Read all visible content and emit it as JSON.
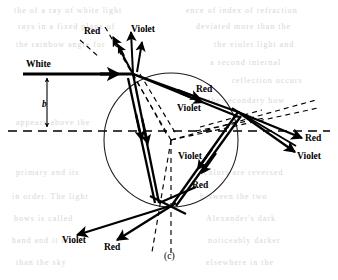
{
  "figure": {
    "caption": "(c)",
    "caption_label": "c",
    "labels": {
      "white": "White",
      "impact_parameter": "b",
      "red": "Red",
      "violet": "Violet"
    },
    "label_positions": [
      {
        "id": "white-ray-label",
        "text": "White",
        "x": 26,
        "y": 60,
        "italic": false
      },
      {
        "id": "impact-parameter-label",
        "text": "b",
        "x": 42,
        "y": 100,
        "italic": true
      },
      {
        "id": "red-label-top",
        "text": "Red",
        "x": 84,
        "y": 27,
        "italic": false
      },
      {
        "id": "violet-label-top",
        "text": "Violet",
        "x": 131,
        "y": 25,
        "italic": false
      },
      {
        "id": "red-label-inner-upper",
        "text": "Red",
        "x": 196,
        "y": 85,
        "italic": false
      },
      {
        "id": "violet-label-inner",
        "text": "Violet",
        "x": 177,
        "y": 104,
        "italic": false
      },
      {
        "id": "red-label-right-exit",
        "text": "Red",
        "x": 305,
        "y": 134,
        "italic": false
      },
      {
        "id": "violet-label-right-exit",
        "text": "Violet",
        "x": 297,
        "y": 152,
        "italic": false
      },
      {
        "id": "violet-label-lower",
        "text": "Violet",
        "x": 178,
        "y": 152,
        "italic": false
      },
      {
        "id": "red-label-lower-inner",
        "text": "Red",
        "x": 192,
        "y": 181,
        "italic": false
      },
      {
        "id": "violet-label-exit-left",
        "text": "Violet",
        "x": 62,
        "y": 236,
        "italic": false
      },
      {
        "id": "red-label-exit-left",
        "text": "Red",
        "x": 104,
        "y": 243,
        "italic": false
      }
    ]
  },
  "chart_data": {
    "type": "diagram",
    "subtitle": "(c)",
    "drop": {
      "center_x": 171,
      "center_y": 140,
      "radius": 67,
      "stroke": "#1a1a1a"
    },
    "axis": {
      "kind": "horizontal-dashed-axis",
      "y": 131,
      "x_start": 8,
      "x_end": 330
    },
    "impact_parameter": {
      "symbol": "b",
      "from_y": 74,
      "to_y": 131,
      "x": 47
    },
    "incident_ray": {
      "label": "White",
      "from": [
        23,
        74
      ],
      "to": [
        133,
        74
      ],
      "color": "#000000"
    },
    "vertex_points": {
      "entry": [
        133,
        74
      ],
      "right_internal_reflection": [
        238,
        112
      ],
      "lower_internal_reflection_violet": [
        159,
        203
      ],
      "lower_internal_reflection_red": [
        173,
        205
      ]
    },
    "ray_colors": {
      "red": "#000000",
      "violet": "#000000",
      "dashed_normal": "#2a2a2a"
    },
    "legend_entries": [
      "White",
      "Red",
      "Violet"
    ]
  },
  "ghost_text": [
    {
      "text": "the  of  a  ray  of  white  light",
      "x": 14,
      "y": 6
    },
    {
      "text": "ence  of  index  of  refraction",
      "x": 186,
      "y": 6
    },
    {
      "text": "rays  in  a  fixed  plane  of",
      "x": 18,
      "y": 22
    },
    {
      "text": "deviated  more  than  the",
      "x": 196,
      "y": 22
    },
    {
      "text": "the  rainbow  angle  for",
      "x": 16,
      "y": 40
    },
    {
      "text": "the  violet  light  and",
      "x": 214,
      "y": 40
    },
    {
      "text": "a  second  internal",
      "x": 210,
      "y": 58
    },
    {
      "text": "reflection  occurs",
      "x": 232,
      "y": 76
    },
    {
      "text": "the  secondary  bow",
      "x": 208,
      "y": 96
    },
    {
      "text": "appears  above  the",
      "x": 16,
      "y": 118
    },
    {
      "text": "primary  and  its",
      "x": 16,
      "y": 168
    },
    {
      "text": "colors  are  reversed",
      "x": 204,
      "y": 168
    },
    {
      "text": "in  order.  The  light",
      "x": 12,
      "y": 192
    },
    {
      "text": "between  the  two",
      "x": 200,
      "y": 192
    },
    {
      "text": "bows  is  called",
      "x": 14,
      "y": 214
    },
    {
      "text": "Alexander's  dark",
      "x": 206,
      "y": 214
    },
    {
      "text": "band  and  it  is",
      "x": 12,
      "y": 236
    },
    {
      "text": "noticeably  darker",
      "x": 208,
      "y": 236
    },
    {
      "text": "than  the  sky",
      "x": 16,
      "y": 258
    },
    {
      "text": "elsewhere  in  the",
      "x": 206,
      "y": 258
    }
  ]
}
